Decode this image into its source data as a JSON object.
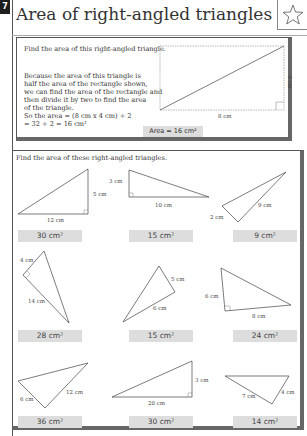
{
  "page_tab": "7",
  "title": "Area of right-angled triangles",
  "star_icon": "star-outline-icon",
  "example": {
    "prompt": "Find the area of this right-angled triangle.",
    "explanation": [
      "Because the area of this triangle is",
      "half the area of the rectangle shown,",
      "we can find the area of the rectangle and",
      "then divide it by two to find the area",
      "of the triangle.",
      "So the area = (8 cm x 4 cm) ÷ 2",
      "= 32 ÷ 2 = 16 cm²"
    ],
    "width_label": "8 cm",
    "height_label": "4 cm",
    "answer": "Area = 16 cm²"
  },
  "exercise": {
    "instruction": "Find the area of these right-angled triangles.",
    "items": [
      {
        "labels": [
          "12 cm",
          "5 cm"
        ],
        "answer": "30 cm²"
      },
      {
        "labels": [
          "3 cm",
          "10 cm"
        ],
        "answer": "15 cm²"
      },
      {
        "labels": [
          "2 cm",
          "9 cm"
        ],
        "answer": "9 cm²"
      },
      {
        "labels": [
          "4 cm",
          "14 cm"
        ],
        "answer": "28 cm²"
      },
      {
        "labels": [
          "5 cm",
          "6 cm"
        ],
        "answer": "15 cm²"
      },
      {
        "labels": [
          "6 cm",
          "8 cm"
        ],
        "answer": "24 cm²"
      },
      {
        "labels": [
          "6 cm",
          "12 cm"
        ],
        "answer": "36 cm²"
      },
      {
        "labels": [
          "3 cm",
          "20 cm"
        ],
        "answer": "30 cm²"
      },
      {
        "labels": [
          "7 cm",
          "4 cm"
        ],
        "answer": "14 cm²"
      }
    ]
  }
}
